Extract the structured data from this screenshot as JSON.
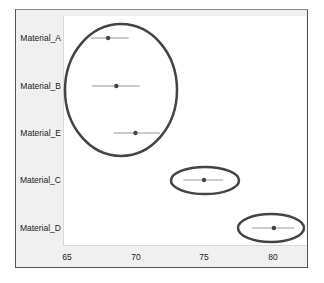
{
  "chart_data": {
    "type": "scatter",
    "subtype": "dot-plot-with-horizontal-error-bars",
    "title": "",
    "xlabel": "",
    "ylabel": "",
    "xlim": [
      64.7,
      82.4
    ],
    "x_ticks": [
      65,
      70,
      75,
      80
    ],
    "x_tick_labels": [
      "65",
      "70",
      "75",
      "80"
    ],
    "grid": false,
    "legend": null,
    "categories": [
      "Material_A",
      "Material_B",
      "Material_E",
      "Material_C",
      "Material_D"
    ],
    "series": [
      {
        "name": "mean",
        "values": [
          68.0,
          68.6,
          70.0,
          75.0,
          80.1
        ],
        "error_low": [
          66.7,
          66.8,
          68.4,
          73.5,
          78.5
        ],
        "error_high": [
          69.5,
          70.3,
          71.8,
          76.4,
          81.6
        ]
      }
    ],
    "annotations": [
      {
        "type": "ellipse",
        "encloses": [
          "Material_A",
          "Material_B",
          "Material_E"
        ],
        "label": "group-1"
      },
      {
        "type": "ellipse",
        "encloses": [
          "Material_C"
        ],
        "label": "group-2"
      },
      {
        "type": "ellipse",
        "encloses": [
          "Material_D"
        ],
        "label": "group-3"
      }
    ]
  },
  "axis": {
    "y_labels": [
      "Material_A",
      "Material_B",
      "Material_E",
      "Material_C",
      "Material_D"
    ],
    "x_labels": [
      "65",
      "70",
      "75",
      "80"
    ]
  },
  "colors": {
    "frame_bg": "#f0f0f0",
    "plot_bg": "#ffffff",
    "point": "#444444",
    "error_bar": "#999999",
    "ellipse": "#444444"
  }
}
